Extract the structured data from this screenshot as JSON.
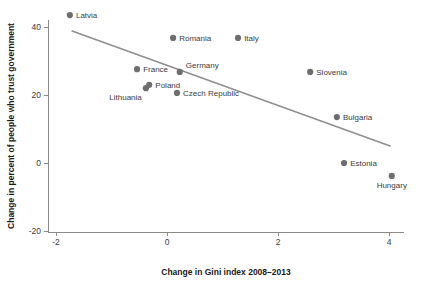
{
  "chart_data": {
    "type": "scatter",
    "title": "",
    "xlabel": "Change in Gini index 2008–2013",
    "ylabel": "Change in percent of people who trust government",
    "xlim": [
      -2.35,
      4.45
    ],
    "ylim": [
      -20,
      45
    ],
    "grid": false,
    "legend": "none",
    "xticks": [
      -2,
      0,
      2,
      4
    ],
    "xtick_labels": [
      "-2",
      "0",
      "2",
      "4"
    ],
    "yticks": [
      -20,
      0,
      20,
      40
    ],
    "ytick_labels": [
      "-20",
      "0",
      "20",
      "40"
    ],
    "marker_color": "#6e6e6e",
    "line_color": "#8f8f8f",
    "axis_color": "#8a8a8a",
    "points": [
      {
        "label": "Latvia",
        "x": -1.75,
        "y": 43.5,
        "label_pos": "right"
      },
      {
        "label": "Romania",
        "x": 0.11,
        "y": 36.8,
        "label_pos": "right"
      },
      {
        "label": "Italy",
        "x": 1.28,
        "y": 36.8,
        "label_pos": "right"
      },
      {
        "label": "France",
        "x": -0.54,
        "y": 27.6,
        "label_pos": "right"
      },
      {
        "label": "Germany",
        "x": 0.23,
        "y": 26.8,
        "label_pos": "right-up"
      },
      {
        "label": "Poland",
        "x": -0.32,
        "y": 23.0,
        "label_pos": "right"
      },
      {
        "label": "Lithuania",
        "x": -0.38,
        "y": 22.0,
        "label_pos": "below-left"
      },
      {
        "label": "Czech Republic",
        "x": 0.18,
        "y": 20.6,
        "label_pos": "right"
      },
      {
        "label": "Slovenia",
        "x": 2.58,
        "y": 26.8,
        "label_pos": "right"
      },
      {
        "label": "Bulgaria",
        "x": 3.06,
        "y": 13.5,
        "label_pos": "right"
      },
      {
        "label": "Estonia",
        "x": 3.19,
        "y": 0.0,
        "label_pos": "right"
      },
      {
        "label": "Hungary",
        "x": 4.05,
        "y": -3.8,
        "label_pos": "below"
      }
    ],
    "trend_line": {
      "x_start": -1.71,
      "y_start": 38.8,
      "x_end": 4.02,
      "y_end": 5.0
    }
  }
}
